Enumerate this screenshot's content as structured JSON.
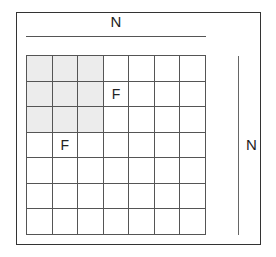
{
  "diagram": {
    "top_dimension_label": "N",
    "right_dimension_label": "N",
    "grid": {
      "rows": 7,
      "cols": 7,
      "shaded_region": {
        "row_start": 0,
        "row_end": 2,
        "col_start": 0,
        "col_end": 2
      },
      "marked_cells": [
        {
          "row": 1,
          "col": 3,
          "label": "F"
        },
        {
          "row": 3,
          "col": 1,
          "label": "F"
        }
      ]
    },
    "colors": {
      "shaded": "#ececec",
      "lines": "#555555",
      "frame": "#333333"
    }
  }
}
